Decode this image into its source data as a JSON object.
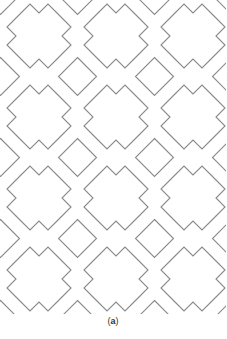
{
  "figure": {
    "caption_open": "(",
    "caption_label": "a",
    "caption_close": ")",
    "stroke_color": "#8a8a8a",
    "background": "#ffffff"
  },
  "pattern": {
    "type": "tessellation",
    "description": "Stepped cross (large) tiles alternating with square diamond tiles",
    "tile_period_x": 77,
    "tile_period_y": 81,
    "origin_x": 39,
    "origin_y": 36,
    "cols": 4,
    "rows": 5,
    "big_cross_points": [
      [
        -18,
        -23
      ],
      [
        -9,
        -32
      ],
      [
        0,
        -23
      ],
      [
        9,
        -32
      ],
      [
        18,
        -23
      ],
      [
        23,
        -18
      ],
      [
        32,
        -9
      ],
      [
        23,
        0
      ],
      [
        32,
        9
      ],
      [
        23,
        18
      ],
      [
        18,
        23
      ],
      [
        9,
        32
      ],
      [
        0,
        23
      ],
      [
        -9,
        32
      ],
      [
        -18,
        23
      ],
      [
        -23,
        18
      ],
      [
        -32,
        9
      ],
      [
        -23,
        0
      ],
      [
        -32,
        -9
      ],
      [
        -23,
        -18
      ]
    ],
    "diamond_points": [
      [
        0,
        -19
      ],
      [
        19,
        0
      ],
      [
        0,
        19
      ],
      [
        -19,
        0
      ]
    ]
  }
}
